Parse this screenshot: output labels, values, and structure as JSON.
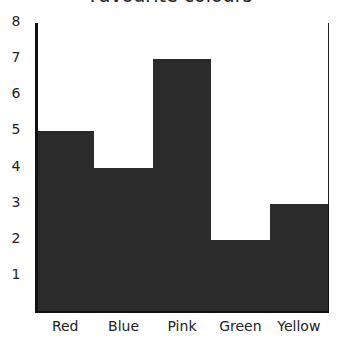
{
  "chart_data": {
    "type": "bar",
    "title": "Favourite colours",
    "categories": [
      "Red",
      "Blue",
      "Pink",
      "Green",
      "Yellow"
    ],
    "values": [
      5,
      4,
      7,
      2,
      3
    ],
    "xlabel": "",
    "ylabel": "",
    "ylim": [
      0,
      8
    ],
    "yticks": [
      "1",
      "2",
      "3",
      "4",
      "5",
      "6",
      "7",
      "8"
    ],
    "grid": true,
    "bar_color": "#2b2b2b",
    "legend": null
  }
}
